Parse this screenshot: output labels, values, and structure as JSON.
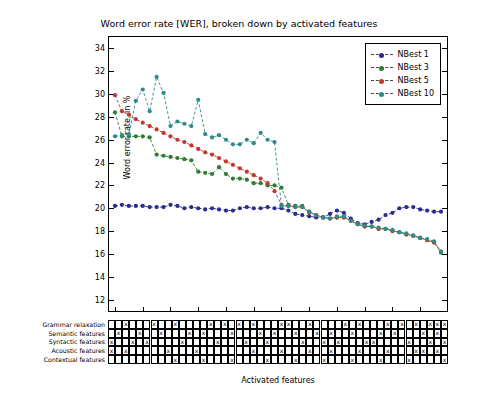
{
  "chart_data": {
    "type": "line",
    "title": "Word error rate [WER], broken down by activated features",
    "xlabel": "Activated features",
    "ylabel": "Word error rate, in %",
    "ylim": [
      11,
      35
    ],
    "yticks": [
      12,
      14,
      16,
      18,
      20,
      22,
      24,
      26,
      28,
      30,
      32,
      34
    ],
    "grid": false,
    "legend_position": "top-right",
    "x_count": 48,
    "series": [
      {
        "name": "NBest 1",
        "color": "#2b2b8f",
        "values": [
          20.2,
          20.3,
          20.2,
          20.2,
          20.2,
          20.1,
          20.1,
          20.1,
          20.3,
          20.2,
          20.0,
          20.1,
          20.0,
          19.9,
          20.0,
          19.9,
          19.8,
          19.8,
          20.0,
          20.1,
          20.0,
          20.0,
          20.1,
          20.0,
          20.0,
          19.8,
          19.5,
          19.4,
          19.3,
          19.2,
          19.2,
          19.5,
          19.8,
          19.6,
          19.1,
          18.7,
          18.6,
          18.8,
          19.0,
          19.4,
          19.6,
          20.0,
          20.1,
          20.1,
          19.9,
          19.8,
          19.7,
          19.7
        ]
      },
      {
        "name": "NBest 3",
        "color": "#2e7d32",
        "values": [
          28.4,
          26.3,
          26.3,
          26.3,
          26.3,
          26.2,
          24.7,
          24.6,
          24.5,
          24.4,
          24.3,
          24.2,
          23.2,
          23.1,
          23.0,
          23.6,
          23.0,
          22.6,
          22.6,
          22.5,
          22.2,
          22.2,
          22.0,
          22.0,
          21.8,
          20.3,
          20.2,
          20.2,
          19.7,
          19.4,
          19.2,
          19.1,
          19.2,
          19.2,
          18.9,
          18.6,
          18.4,
          18.4,
          18.2,
          18.2,
          18.0,
          17.9,
          17.7,
          17.6,
          17.4,
          17.2,
          17.0,
          16.1
        ]
      },
      {
        "name": "NBest 5",
        "color": "#c0392b",
        "values": [
          29.9,
          28.5,
          28.2,
          27.8,
          27.5,
          27.2,
          26.9,
          26.6,
          26.3,
          26.0,
          25.8,
          25.5,
          25.2,
          24.9,
          24.7,
          24.4,
          24.1,
          23.8,
          23.5,
          23.2,
          22.9,
          22.6,
          22.2,
          21.5,
          20.3,
          20.2,
          20.1,
          20.1,
          19.6,
          19.4,
          19.2,
          19.1,
          19.2,
          19.2,
          18.9,
          18.6,
          18.4,
          18.4,
          18.2,
          18.2,
          18.0,
          17.9,
          17.7,
          17.6,
          17.4,
          17.2,
          17.0,
          16.2
        ]
      },
      {
        "name": "NBest 10",
        "color": "#2e8b8b",
        "values": [
          26.3,
          26.4,
          26.5,
          29.4,
          30.4,
          28.5,
          31.5,
          30.1,
          27.2,
          27.6,
          27.4,
          27.2,
          29.5,
          26.5,
          26.2,
          26.4,
          26.0,
          25.6,
          25.6,
          26.0,
          25.7,
          26.6,
          26.0,
          25.8,
          20.2,
          20.2,
          20.1,
          20.1,
          19.7,
          19.4,
          19.2,
          19.1,
          19.3,
          19.3,
          18.9,
          18.6,
          18.5,
          18.4,
          18.3,
          18.2,
          18.1,
          17.9,
          17.8,
          17.6,
          17.4,
          17.3,
          17.1,
          16.2
        ]
      }
    ]
  },
  "feature_table": {
    "mark": "x",
    "rows": [
      {
        "label": "Grammar relaxation",
        "marks": [
          2,
          6,
          9,
          14,
          16,
          18,
          20,
          24,
          25,
          28,
          33,
          35,
          39,
          41,
          43,
          45,
          46,
          47
        ]
      },
      {
        "label": "Semantic features",
        "marks": [
          1,
          4,
          7,
          11,
          13,
          17,
          21,
          23,
          26,
          29,
          31,
          34,
          38,
          40,
          44,
          46
        ]
      },
      {
        "label": "Syntactic features",
        "marks": [
          0,
          3,
          5,
          10,
          15,
          19,
          22,
          27,
          30,
          32,
          36,
          37,
          42,
          45,
          47
        ]
      },
      {
        "label": "Acoustic features",
        "marks": [
          0,
          2,
          8,
          12,
          20,
          24,
          28,
          31,
          35,
          39,
          43,
          44,
          46
        ]
      },
      {
        "label": "Contextual features",
        "marks": [
          9,
          13,
          17,
          22,
          26,
          30,
          34,
          38,
          42,
          47
        ]
      }
    ]
  }
}
